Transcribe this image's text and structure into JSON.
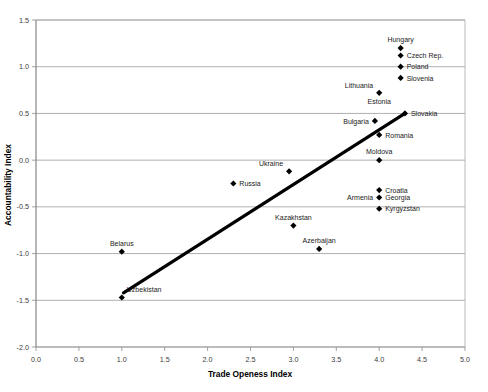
{
  "chart_data": {
    "type": "scatter",
    "title": "",
    "xlabel": "Trade Openess Index",
    "ylabel": "Accountability Index",
    "xlim": [
      0.0,
      5.0
    ],
    "ylim": [
      -2.0,
      1.5
    ],
    "grid": true,
    "legend": "none",
    "x_ticks": [
      "0.0",
      "0.5",
      "1.0",
      "1.5",
      "2.0",
      "2.5",
      "3.0",
      "3.5",
      "4.0",
      "4.5",
      "5.0"
    ],
    "y_ticks": [
      "1.5",
      "1.0",
      "0.5",
      "0.0",
      "-0.5",
      "-1.0",
      "-1.5",
      "-2.0"
    ],
    "points": [
      {
        "label": "Hungary",
        "x": 4.25,
        "y": 1.2,
        "label_pos": "above"
      },
      {
        "label": "Czech Rep.",
        "x": 4.25,
        "y": 1.12,
        "label_pos": "right"
      },
      {
        "label": "Poland",
        "x": 4.25,
        "y": 1.0,
        "label_pos": "right"
      },
      {
        "label": "Slovenia",
        "x": 4.25,
        "y": 0.88,
        "label_pos": "right"
      },
      {
        "label": "Lithuania",
        "x": 4.0,
        "y": 0.72,
        "label_pos": "above-left"
      },
      {
        "label": "Estonia",
        "x": 4.0,
        "y": 0.72,
        "label_pos": "below"
      },
      {
        "label": "Slovakia",
        "x": 4.3,
        "y": 0.5,
        "label_pos": "right"
      },
      {
        "label": "Bulgaria",
        "x": 3.95,
        "y": 0.42,
        "label_pos": "left"
      },
      {
        "label": "Romania",
        "x": 4.0,
        "y": 0.27,
        "label_pos": "right"
      },
      {
        "label": "Moldova",
        "x": 4.0,
        "y": 0.0,
        "label_pos": "above"
      },
      {
        "label": "Ukraine",
        "x": 2.95,
        "y": -0.12,
        "label_pos": "above-left"
      },
      {
        "label": "Russia",
        "x": 2.3,
        "y": -0.25,
        "label_pos": "right"
      },
      {
        "label": "Croatia",
        "x": 4.0,
        "y": -0.32,
        "label_pos": "right"
      },
      {
        "label": "Georgia",
        "x": 4.0,
        "y": -0.4,
        "label_pos": "right"
      },
      {
        "label": "Armenia",
        "x": 4.0,
        "y": -0.4,
        "label_pos": "left"
      },
      {
        "label": "Kyrgyzstan",
        "x": 4.0,
        "y": -0.52,
        "label_pos": "right"
      },
      {
        "label": "Kazakhstan",
        "x": 3.0,
        "y": -0.7,
        "label_pos": "above"
      },
      {
        "label": "Azerbaijan",
        "x": 3.3,
        "y": -0.95,
        "label_pos": "above"
      },
      {
        "label": "Belarus",
        "x": 1.0,
        "y": -0.98,
        "label_pos": "above"
      },
      {
        "label": "Uzbekistan",
        "x": 1.0,
        "y": -1.47,
        "label_pos": "above-right"
      }
    ],
    "trendline": {
      "x0": 1.02,
      "y0": -1.42,
      "x1": 4.3,
      "y1": 0.5
    }
  },
  "colors": {
    "marker": "#000000",
    "trendline": "#000000",
    "grid": "#8c8c8c",
    "axis": "#7a7a7a",
    "background": "#ffffff"
  }
}
